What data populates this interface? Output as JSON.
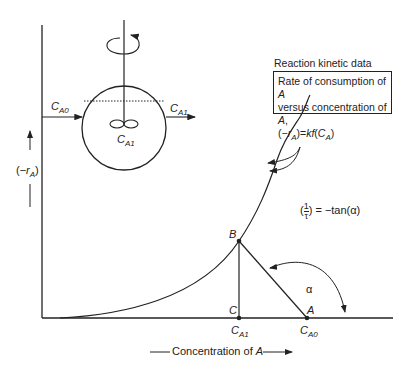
{
  "diagram": {
    "title_label": "Reaction kinetic data",
    "box": {
      "line1": "Rate of consumption of A",
      "line2": "versus concentration of A,",
      "line3": "(−r_A)=kf(C_A)"
    },
    "y_axis_label": "(−r_A)",
    "x_axis_label": "Concentration of A",
    "reactor": {
      "inlet_label": "C_A0",
      "outlet_label": "C_A1",
      "inside_label": "C_A1"
    },
    "slope_equation": "(1/τ) = −tan(α)",
    "points": {
      "B": "B",
      "C": "C",
      "A": "A"
    },
    "x_ticks": [
      "C_A1",
      "C_A0"
    ],
    "angle_label": "α"
  }
}
